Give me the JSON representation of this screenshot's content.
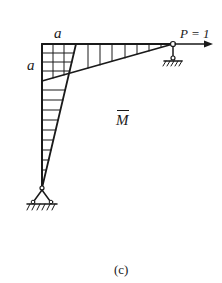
{
  "diagram": {
    "type": "bending-moment-diagram",
    "labels": {
      "dimension_top": "a",
      "dimension_left": "a",
      "load": "P = 1",
      "moment": "M",
      "caption": "(c)"
    },
    "elements": {
      "frame_corner": [
        42,
        44
      ],
      "beam_end_hinge": [
        173,
        44
      ],
      "column_base_hinge": [
        42,
        188
      ],
      "load_arrow": {
        "from": [
          173,
          44
        ],
        "to": [
          212,
          44
        ],
        "direction": "right"
      },
      "beam_moment_diagram": "triangular, max at frame corner, zero at right hinge",
      "column_moment_diagram": "triangular, max at frame corner, zero at base hinge",
      "overlap_region": "cross-hatched grid a × a at corner"
    },
    "colors": {
      "line": "#1a1a1a",
      "background": "#ffffff"
    }
  }
}
